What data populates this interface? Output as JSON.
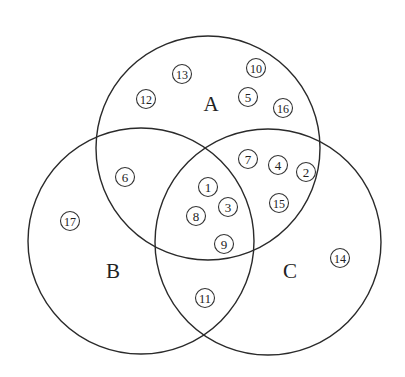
{
  "diagram": {
    "type": "venn-3-set",
    "sets": [
      {
        "label": "A",
        "cx": 208,
        "cy": 148,
        "r": 112,
        "label_x": 211,
        "label_y": 111
      },
      {
        "label": "B",
        "cx": 141,
        "cy": 241,
        "r": 113,
        "label_x": 113,
        "label_y": 278
      },
      {
        "label": "C",
        "cx": 268,
        "cy": 242,
        "r": 113,
        "label_x": 290,
        "label_y": 278
      }
    ],
    "elements": [
      {
        "num": "12",
        "x": 146,
        "y": 99,
        "region": "A only"
      },
      {
        "num": "13",
        "x": 182,
        "y": 74,
        "region": "A only"
      },
      {
        "num": "10",
        "x": 256,
        "y": 68,
        "region": "A only"
      },
      {
        "num": "5",
        "x": 248,
        "y": 97,
        "region": "A only"
      },
      {
        "num": "16",
        "x": 283,
        "y": 108,
        "region": "A only"
      },
      {
        "num": "6",
        "x": 125,
        "y": 177,
        "region": "A∩B only"
      },
      {
        "num": "7",
        "x": 248,
        "y": 159,
        "region": "A∩C only"
      },
      {
        "num": "4",
        "x": 278,
        "y": 165,
        "region": "A∩C only"
      },
      {
        "num": "2",
        "x": 306,
        "y": 172,
        "region": "A∩C only"
      },
      {
        "num": "15",
        "x": 279,
        "y": 203,
        "region": "A∩C only"
      },
      {
        "num": "1",
        "x": 208,
        "y": 187,
        "region": "A∩B∩C"
      },
      {
        "num": "3",
        "x": 228,
        "y": 207,
        "region": "A∩B∩C"
      },
      {
        "num": "8",
        "x": 196,
        "y": 216,
        "region": "A∩B∩C"
      },
      {
        "num": "9",
        "x": 224,
        "y": 244,
        "region": "A∩B∩C"
      },
      {
        "num": "17",
        "x": 70,
        "y": 221,
        "region": "B only"
      },
      {
        "num": "11",
        "x": 205,
        "y": 298,
        "region": "B∩C only"
      },
      {
        "num": "14",
        "x": 340,
        "y": 258,
        "region": "C only"
      }
    ]
  }
}
